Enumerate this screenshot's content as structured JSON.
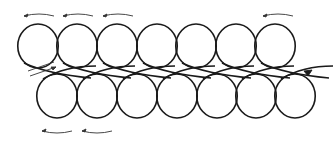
{
  "diagram": {
    "type": "looped-coil-path",
    "stroke_color": "#1a1a1a",
    "arrow_color": "#333333",
    "background": "#ffffff",
    "top_row": {
      "count": 7,
      "cx": [
        38,
        77,
        117,
        157,
        196,
        236,
        275
      ],
      "cy": 46,
      "r": 22
    },
    "bottom_row": {
      "count": 7,
      "cx": [
        57,
        97,
        137,
        177,
        217,
        256,
        295
      ],
      "cy": 96,
      "r": 22
    },
    "direction_arrows": {
      "top": [
        {
          "x1": 54,
          "x2": 24,
          "y": 16
        },
        {
          "x1": 93,
          "x2": 63,
          "y": 16
        },
        {
          "x1": 133,
          "x2": 103,
          "y": 16
        },
        {
          "x1": 293,
          "x2": 263,
          "y": 16
        }
      ],
      "bottom": [
        {
          "x1": 72,
          "x2": 42,
          "y": 131
        },
        {
          "x1": 112,
          "x2": 82,
          "y": 131
        }
      ],
      "entry": {
        "x1": 30,
        "y1": 76,
        "x2": 56,
        "y2": 67
      },
      "exit": {
        "x": 312,
        "y": 70
      }
    }
  }
}
